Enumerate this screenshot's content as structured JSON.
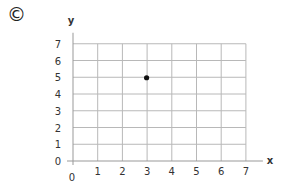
{
  "panel_label": "©",
  "chart_data": {
    "type": "scatter",
    "title": "",
    "xlabel": "x",
    "ylabel": "y",
    "xlim": [
      0,
      7
    ],
    "ylim": [
      0,
      7
    ],
    "x_ticks": [
      "1",
      "2",
      "3",
      "4",
      "5",
      "6",
      "7"
    ],
    "y_ticks": [
      "0",
      "1",
      "2",
      "3",
      "4",
      "5",
      "6",
      "7"
    ],
    "origin_label": "0",
    "grid": true,
    "legend": null,
    "series": [
      {
        "name": "point",
        "points": [
          {
            "x": 3,
            "y": 5
          }
        ]
      }
    ]
  }
}
